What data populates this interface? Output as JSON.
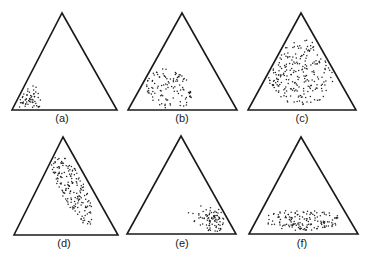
{
  "figure": {
    "type": "ternary-scatter-grid",
    "ink_color": "#1a1a1a",
    "background": "#ffffff",
    "panels": [
      {
        "id": "a",
        "label": "(a)",
        "triangle": {
          "apex": [
            62,
            13
          ],
          "left": [
            12,
            110
          ],
          "right": [
            117,
            110
          ]
        },
        "label_pos": [
          62,
          122
        ],
        "cluster": {
          "description": "tight cluster near bottom-left vertex",
          "center": [
            28,
            98
          ],
          "spread": [
            7,
            6
          ],
          "angle": 0,
          "count": 55,
          "dense_core": true
        }
      },
      {
        "id": "b",
        "label": "(b)",
        "triangle": {
          "apex": [
            182,
            13
          ],
          "left": [
            128,
            110
          ],
          "right": [
            237,
            110
          ]
        },
        "label_pos": [
          182,
          122
        ],
        "cluster": {
          "description": "moderate cluster lower-left of center",
          "center": [
            169,
            89
          ],
          "spread": [
            14,
            11
          ],
          "angle": 30,
          "count": 110,
          "dense_core": false
        }
      },
      {
        "id": "c",
        "label": "(c)",
        "triangle": {
          "apex": [
            301,
            13
          ],
          "left": [
            248,
            110
          ],
          "right": [
            356,
            110
          ]
        },
        "label_pos": [
          302,
          122
        ],
        "cluster": {
          "description": "broad cluster filling center of triangle",
          "center": [
            302,
            72
          ],
          "spread": [
            20,
            19
          ],
          "angle": 0,
          "count": 230,
          "dense_core": false
        }
      },
      {
        "id": "d",
        "label": "(d)",
        "triangle": {
          "apex": [
            63,
            137
          ],
          "left": [
            14,
            235
          ],
          "right": [
            118,
            235
          ]
        },
        "label_pos": [
          64,
          247
        ],
        "cluster": {
          "description": "elongated band parallel to right edge",
          "center": [
            72,
            188
          ],
          "spread": [
            7,
            24
          ],
          "angle": -27,
          "count": 170,
          "dense_core": false
        }
      },
      {
        "id": "e",
        "label": "(e)",
        "triangle": {
          "apex": [
            181,
            136
          ],
          "left": [
            127,
            234
          ],
          "right": [
            236,
            234
          ]
        },
        "label_pos": [
          182,
          247
        ],
        "cluster": {
          "description": "tight cluster near bottom-right vertex",
          "center": [
            212,
            220
          ],
          "spread": [
            8,
            7
          ],
          "angle": 0,
          "count": 85,
          "dense_core": true
        }
      },
      {
        "id": "f",
        "label": "(f)",
        "triangle": {
          "apex": [
            301,
            137
          ],
          "left": [
            249,
            234
          ],
          "right": [
            358,
            234
          ]
        },
        "label_pos": [
          302,
          247
        ],
        "cluster": {
          "description": "flat horizontal band along base",
          "center": [
            303,
            220
          ],
          "spread": [
            22,
            6
          ],
          "angle": 0,
          "count": 150,
          "dense_core": false
        }
      }
    ]
  }
}
